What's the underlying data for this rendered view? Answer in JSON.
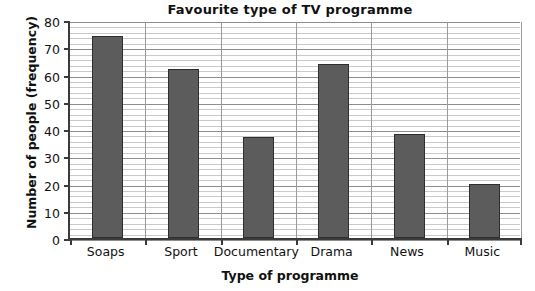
{
  "chart_data": {
    "type": "bar",
    "title": "Favourite type of TV programme",
    "xlabel": "Type of programme",
    "ylabel": "Number of people (frequency)",
    "categories": [
      "Soaps",
      "Sport",
      "Documentary",
      "Drama",
      "News",
      "Music"
    ],
    "values": [
      74,
      62,
      37,
      64,
      38,
      20
    ],
    "ylim": [
      0,
      80
    ],
    "ytick_labels": [
      "0",
      "10",
      "20",
      "30",
      "40",
      "50",
      "60",
      "70",
      "80"
    ],
    "ytick_values": [
      0,
      10,
      20,
      30,
      40,
      50,
      60,
      70,
      80
    ],
    "y_major_step": 10,
    "y_minor_step": 2,
    "grid": "horizontal-major-and-minor, vertical-major",
    "legend": null,
    "bar_color": "#5c5c5c",
    "bar_edge_color": "#2e2e2e",
    "grid_color": "#c9c9c9",
    "axis_color": "#3b3b3b",
    "background": "#ffffff"
  }
}
